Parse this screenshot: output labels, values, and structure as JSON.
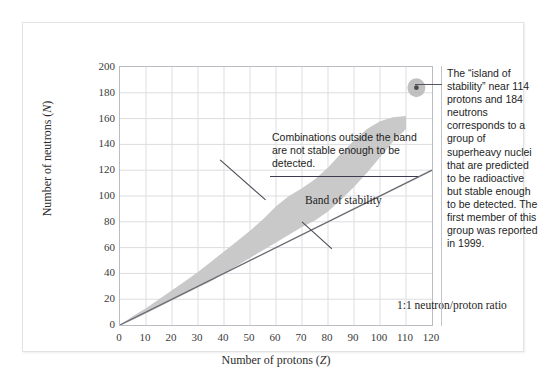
{
  "chart_data": {
    "type": "area",
    "title": "",
    "xlabel": "Number of protons (Z)",
    "ylabel": "Number of neutrons (N)",
    "xlim": [
      0,
      120
    ],
    "ylim": [
      0,
      200
    ],
    "xticks": [
      0,
      10,
      20,
      30,
      40,
      50,
      60,
      70,
      80,
      90,
      100,
      110,
      120
    ],
    "yticks": [
      0,
      20,
      40,
      60,
      80,
      100,
      120,
      140,
      160,
      180,
      200
    ],
    "grid": true,
    "legend": "none",
    "series": [
      {
        "name": "Band of stability",
        "type": "band",
        "color": "#c9c9c9",
        "x": [
          0,
          5,
          10,
          15,
          20,
          25,
          30,
          35,
          40,
          45,
          50,
          55,
          60,
          65,
          70,
          75,
          80,
          85,
          90,
          95,
          100,
          105,
          110
        ],
        "lower": [
          0,
          4,
          9,
          14,
          19,
          24,
          29,
          34,
          40,
          46,
          52,
          58,
          64,
          70,
          76,
          81,
          88,
          97,
          107,
          118,
          130,
          142,
          152
        ],
        "upper": [
          0,
          7,
          13,
          20,
          27,
          34,
          41,
          49,
          57,
          65,
          73,
          82,
          92,
          100,
          106,
          113,
          122,
          133,
          143,
          152,
          158,
          161,
          162
        ]
      },
      {
        "name": "1:1 neutron/proton ratio",
        "type": "line",
        "color": "#6b6b74",
        "x": [
          0,
          120
        ],
        "y": [
          0,
          120
        ]
      },
      {
        "name": "Island of stability",
        "type": "scatter",
        "color": "#8d8d8d",
        "points": [
          {
            "x": 114,
            "y": 184
          }
        ]
      }
    ],
    "annotations": [
      {
        "name": "outside-band-note",
        "text": "Combinations outside the band are not stable enough to be detected.",
        "x": 24,
        "y": 170
      },
      {
        "name": "band-label",
        "text": "Band of stability",
        "x": 35,
        "y": 133
      },
      {
        "name": "ratio-label",
        "text": "1:1 neutron/proton ratio",
        "x": 70,
        "y": 63
      },
      {
        "name": "island-note",
        "text": "The “island of stability” near 114 protons and 184 neutrons corresponds to a group of superheavy nuclei that are predicted to be radioactive but stable enough to be detected. The first member of this group was reported in 1999.",
        "x": 114,
        "y": 184
      }
    ]
  },
  "axes": {
    "y_title_prefix": "Number of neutrons (",
    "y_title_var": "N",
    "y_title_suffix": ")",
    "x_title_prefix": "Number of protons (",
    "x_title_var": "Z",
    "x_title_suffix": ")"
  },
  "labels": {
    "callout_outside_band": "Combinations outside the band are not stable enough to be detected.",
    "band_of_stability": "Band of stability",
    "ratio": "1:1 neutron/proton ratio",
    "island_note": "The “island of stability” near 114 protons and 184 neutrons corresponds to a group of superheavy nuclei that are predicted to be radioactive but stable enough to be detected. The first member of this group was reported in 1999."
  },
  "colors": {
    "band_fill": "#c9c9c9",
    "ratio_line": "#6b6b74",
    "grid": "#dcdde1",
    "plot_border": "#b9bcc2",
    "island_blob": "#b6b6b6",
    "island_dot": "#4a4a4a",
    "frame": "#e2e2e2",
    "text": "#1d1d1d"
  }
}
